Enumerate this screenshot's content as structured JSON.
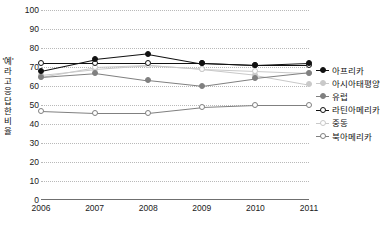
{
  "chart_data": {
    "type": "line",
    "title": "",
    "xlabel": "",
    "ylabel": "'예' 라고 응답한 비율",
    "x": [
      "2006",
      "2007",
      "2008",
      "2009",
      "2010",
      "2011"
    ],
    "ylim": [
      0,
      100
    ],
    "ytick_labels": [
      "0",
      "10",
      "20",
      "30",
      "40",
      "50",
      "60",
      "70",
      "80",
      "90",
      "100"
    ],
    "ytick_values": [
      0,
      10,
      20,
      30,
      40,
      50,
      60,
      70,
      80,
      90,
      100
    ],
    "grid": true,
    "legend_position": "right",
    "series": [
      {
        "name": "아프리카",
        "color": "#111111",
        "marker": "filled-circle",
        "values": [
          68,
          74,
          77,
          72,
          71,
          72
        ]
      },
      {
        "name": "아시아태평양",
        "color": "#c9c9c9",
        "marker": "filled-circle",
        "values": [
          66,
          69,
          71,
          69,
          66,
          61
        ]
      },
      {
        "name": "유럽",
        "color": "#808080",
        "marker": "filled-circle",
        "values": [
          65,
          67,
          63,
          60,
          64,
          67
        ]
      },
      {
        "name": "라틴아메리카",
        "color": "#111111",
        "marker": "open-circle",
        "values": [
          72,
          72,
          72,
          72,
          71,
          71
        ]
      },
      {
        "name": "중동",
        "color": "#c9c9c9",
        "marker": "open-circle",
        "values": [
          65,
          70,
          71,
          69,
          68,
          67
        ]
      },
      {
        "name": "북아메리카",
        "color": "#808080",
        "marker": "open-circle",
        "values": [
          47,
          46,
          46,
          49,
          50,
          50
        ]
      }
    ]
  }
}
